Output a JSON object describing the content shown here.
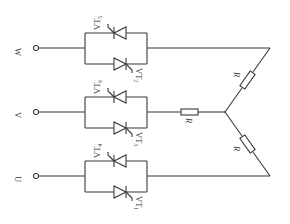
{
  "diagram": {
    "type": "three-phase AC voltage controller with star-connected resistive load",
    "phases": [
      {
        "name": "W",
        "y": 48,
        "thyristor_top": {
          "label": "VT",
          "sub": "5"
        },
        "thyristor_bottom": {
          "label": "VT",
          "sub": "2"
        }
      },
      {
        "name": "V",
        "y": 112,
        "thyristor_top": {
          "label": "VT",
          "sub": "6"
        },
        "thyristor_bottom": {
          "label": "VT",
          "sub": "3"
        }
      },
      {
        "name": "U",
        "y": 176,
        "thyristor_top": {
          "label": "VT",
          "sub": "4"
        },
        "thyristor_bottom": {
          "label": "VT",
          "sub": "1"
        }
      }
    ],
    "resistors": [
      {
        "label": "R",
        "branch": "W"
      },
      {
        "label": "R",
        "branch": "V"
      },
      {
        "label": "R",
        "branch": "U"
      }
    ],
    "colors": {
      "line": "#3a3a3a",
      "text": "#333333",
      "background": "#ffffff"
    }
  }
}
